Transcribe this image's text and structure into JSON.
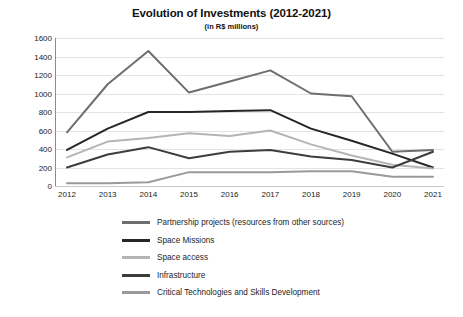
{
  "chart_data": {
    "type": "line",
    "title": "Evolution of Investments (2012-2021)",
    "subtitle": "(in R$ millions)",
    "xlabel": "",
    "ylabel": "",
    "categories": [
      "2012",
      "2013",
      "2014",
      "2015",
      "2016",
      "2017",
      "2018",
      "2019",
      "2020",
      "2021"
    ],
    "ylim": [
      0,
      1600
    ],
    "yticks": [
      0,
      200,
      400,
      600,
      800,
      1000,
      1200,
      1400,
      1600
    ],
    "grid": true,
    "legend_position": "bottom",
    "series": [
      {
        "name": "Partnership projects (resources from other sources)",
        "color": "#6e6e6e",
        "width": 2.0,
        "values": [
          580,
          1100,
          1460,
          1010,
          1130,
          1250,
          1000,
          970,
          370,
          390
        ]
      },
      {
        "name": "Space Missions",
        "color": "#262626",
        "width": 2.0,
        "values": [
          390,
          620,
          800,
          800,
          810,
          820,
          620,
          490,
          350,
          200
        ]
      },
      {
        "name": "Space access",
        "color": "#b5b5b5",
        "width": 2.0,
        "values": [
          310,
          480,
          520,
          570,
          540,
          600,
          450,
          330,
          230,
          190
        ]
      },
      {
        "name": "Infrastructure",
        "color": "#3d3d3d",
        "width": 2.0,
        "values": [
          200,
          340,
          420,
          300,
          370,
          390,
          320,
          280,
          200,
          370
        ]
      },
      {
        "name": "Critical Technologies and Skills Development",
        "color": "#9a9a9a",
        "width": 2.0,
        "values": [
          30,
          30,
          40,
          150,
          150,
          150,
          160,
          160,
          100,
          100
        ]
      }
    ]
  }
}
